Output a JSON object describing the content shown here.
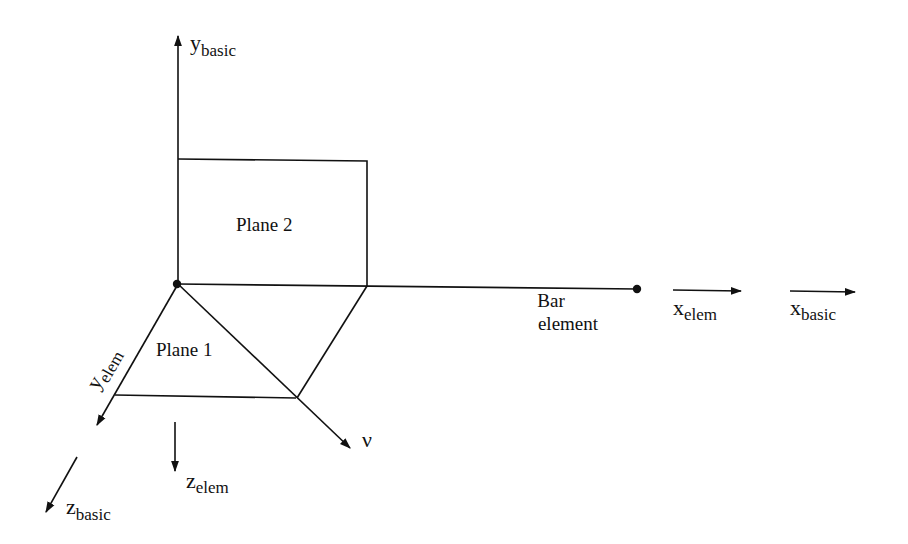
{
  "diagram": {
    "type": "coordinate-system-diagram",
    "colors": {
      "ink": "#111111",
      "background": "#ffffff"
    },
    "axes": {
      "y_basic": {
        "base": "y",
        "sub": "basic"
      },
      "y_elem": {
        "base": "y",
        "sub": "elem"
      },
      "x_elem": {
        "base": "x",
        "sub": "elem"
      },
      "x_basic": {
        "base": "x",
        "sub": "basic"
      },
      "z_elem": {
        "base": "z",
        "sub": "elem"
      },
      "z_basic": {
        "base": "z",
        "sub": "basic"
      },
      "nu": {
        "label": "ν"
      }
    },
    "planes": {
      "plane1": "Plane 1",
      "plane2": "Plane 2"
    },
    "bar": {
      "line1": "Bar",
      "line2": "element"
    }
  }
}
